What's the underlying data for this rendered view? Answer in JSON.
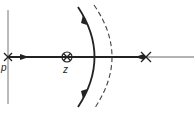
{
  "diagram": {
    "type": "root-locus",
    "labels": {
      "pole": "p",
      "zero": "z"
    },
    "colors": {
      "stroke": "#222222",
      "axis": "#666666",
      "dashed": "#444444",
      "background": "#ffffff"
    },
    "elements": [
      {
        "kind": "vertical-axis",
        "x": 8
      },
      {
        "kind": "real-axis",
        "y": 57
      },
      {
        "kind": "pole",
        "symbol": "x",
        "label": "p",
        "x": 8
      },
      {
        "kind": "zero",
        "symbol": "circled-x",
        "label": "z",
        "x": 67
      },
      {
        "kind": "pole",
        "symbol": "x",
        "x": 146
      },
      {
        "kind": "locus-arc",
        "style": "solid",
        "arrows": [
          "up",
          "down"
        ]
      },
      {
        "kind": "asymptote-arc",
        "style": "dashed"
      },
      {
        "kind": "arrow",
        "direction": "right",
        "on": "segment p-z"
      },
      {
        "kind": "arrow",
        "direction": "left",
        "on": "segment toward right pole"
      }
    ]
  }
}
